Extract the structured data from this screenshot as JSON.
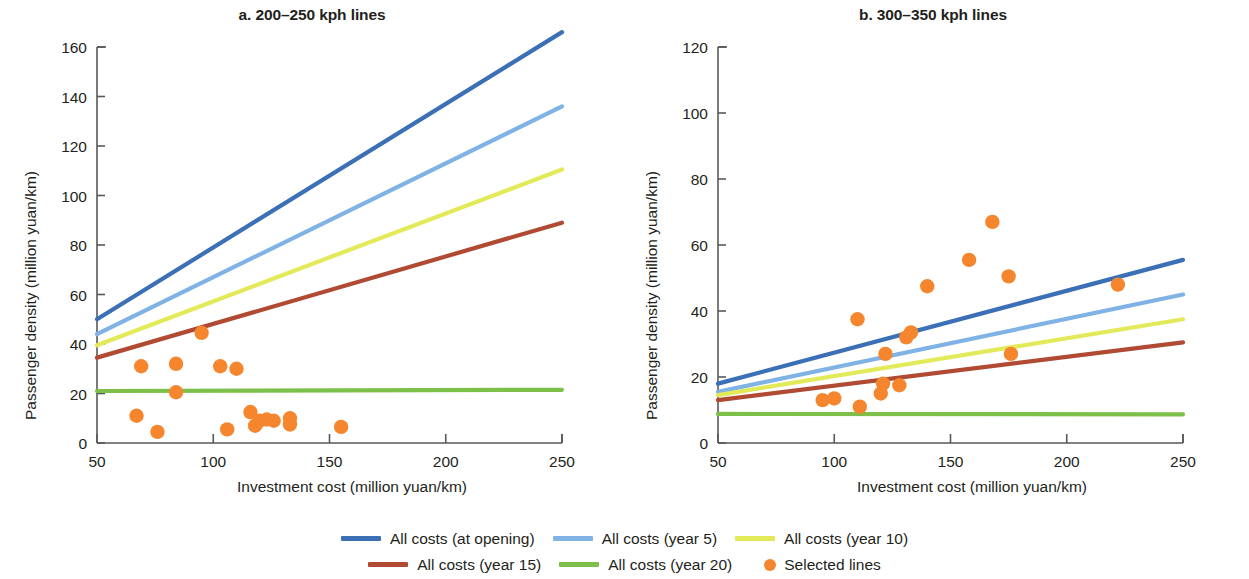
{
  "figure": {
    "background": "#ffffff"
  },
  "panels": [
    {
      "id": "a",
      "title": "a. 200–250 kph lines",
      "xlabel": "Investment cost (million yuan/km)",
      "ylabel": "Passenger density (million yuan/km)"
    },
    {
      "id": "b",
      "title": "b. 300–350 kph lines",
      "xlabel": "Investment cost (million yuan/km)",
      "ylabel": "Passenger density (million yuan/km)"
    }
  ],
  "legend": {
    "rows": [
      [
        {
          "label": "All costs (at opening)",
          "color": "#3b6fb6",
          "marker": "line",
          "name": "legend-all-costs-at-opening"
        },
        {
          "label": "All costs (year 5)",
          "color": "#7fb2e5",
          "marker": "line",
          "name": "legend-all-costs-year-5"
        },
        {
          "label": "All costs (year 10)",
          "color": "#e3ea5a",
          "marker": "line",
          "name": "legend-all-costs-year-10"
        }
      ],
      [
        {
          "label": "All costs (year 15)",
          "color": "#b04a33",
          "marker": "line",
          "name": "legend-all-costs-year-15"
        },
        {
          "label": "All costs (year 20)",
          "color": "#7cc04a",
          "marker": "line",
          "name": "legend-all-costs-year-20"
        },
        {
          "label": "Selected lines",
          "color": "#f5862e",
          "marker": "dot",
          "name": "legend-selected-lines"
        }
      ]
    ]
  },
  "chart_data": [
    {
      "type": "line",
      "panel": "a",
      "title": "a. 200–250 kph lines",
      "xlabel": "Investment cost (million yuan/km)",
      "ylabel": "Passenger density (million yuan/km)",
      "xlim": [
        50,
        250
      ],
      "ylim": [
        0,
        160
      ],
      "xticks": [
        50,
        100,
        150,
        200,
        250
      ],
      "yticks": [
        0,
        20,
        40,
        60,
        80,
        100,
        120,
        140,
        160
      ],
      "grid": false,
      "series": [
        {
          "name": "All costs (at opening)",
          "color": "#3b6fb6",
          "x": [
            50,
            250
          ],
          "values": [
            50,
            166
          ]
        },
        {
          "name": "All costs (year 5)",
          "color": "#7fb2e5",
          "x": [
            50,
            250
          ],
          "values": [
            44,
            136
          ]
        },
        {
          "name": "All costs (year 10)",
          "color": "#e3ea5a",
          "x": [
            50,
            250
          ],
          "values": [
            39.5,
            110.5
          ]
        },
        {
          "name": "All costs (year 15)",
          "color": "#b04a33",
          "x": [
            50,
            250
          ],
          "values": [
            34.5,
            89
          ]
        },
        {
          "name": "All costs (year 20)",
          "color": "#7cc04a",
          "x": [
            50,
            250
          ],
          "values": [
            21,
            21.5
          ]
        }
      ],
      "scatter": {
        "name": "Selected lines",
        "color": "#f5862e",
        "points": [
          [
            67,
            11
          ],
          [
            69,
            31
          ],
          [
            76,
            4.5
          ],
          [
            84,
            32
          ],
          [
            84,
            20.5
          ],
          [
            95,
            44.5
          ],
          [
            103,
            31
          ],
          [
            106,
            5.5
          ],
          [
            110,
            30
          ],
          [
            116,
            12.5
          ],
          [
            118,
            7
          ],
          [
            120,
            9
          ],
          [
            123,
            9.5
          ],
          [
            126,
            9
          ],
          [
            133,
            7.5
          ],
          [
            133,
            10
          ],
          [
            155,
            6.5
          ]
        ]
      }
    },
    {
      "type": "line",
      "panel": "b",
      "title": "b. 300–350 kph lines",
      "xlabel": "Investment cost (million yuan/km)",
      "ylabel": "Passenger density (million yuan/km)",
      "xlim": [
        50,
        250
      ],
      "ylim": [
        0,
        120
      ],
      "xticks": [
        50,
        100,
        150,
        200,
        250
      ],
      "yticks": [
        0,
        20,
        40,
        60,
        80,
        100,
        120
      ],
      "grid": false,
      "series": [
        {
          "name": "All costs (at opening)",
          "color": "#3b6fb6",
          "x": [
            50,
            250
          ],
          "values": [
            18,
            55.5
          ]
        },
        {
          "name": "All costs (year 5)",
          "color": "#7fb2e5",
          "x": [
            50,
            250
          ],
          "values": [
            15.5,
            45
          ]
        },
        {
          "name": "All costs (year 10)",
          "color": "#e3ea5a",
          "x": [
            50,
            250
          ],
          "values": [
            14.5,
            37.5
          ]
        },
        {
          "name": "All costs (year 15)",
          "color": "#b04a33",
          "x": [
            50,
            250
          ],
          "values": [
            13,
            30.5
          ]
        },
        {
          "name": "All costs (year 20)",
          "color": "#7cc04a",
          "x": [
            50,
            250
          ],
          "values": [
            8.8,
            8.7
          ]
        }
      ],
      "scatter": {
        "name": "Selected lines",
        "color": "#f5862e",
        "points": [
          [
            95,
            13
          ],
          [
            100,
            13.5
          ],
          [
            110,
            37.5
          ],
          [
            111,
            11
          ],
          [
            120,
            15
          ],
          [
            121,
            18
          ],
          [
            122,
            27
          ],
          [
            128,
            17.5
          ],
          [
            131,
            32
          ],
          [
            133,
            33.5
          ],
          [
            140,
            47.5
          ],
          [
            158,
            55.5
          ],
          [
            168,
            67
          ],
          [
            175,
            50.5
          ],
          [
            176,
            27
          ],
          [
            222,
            48
          ]
        ]
      }
    }
  ]
}
